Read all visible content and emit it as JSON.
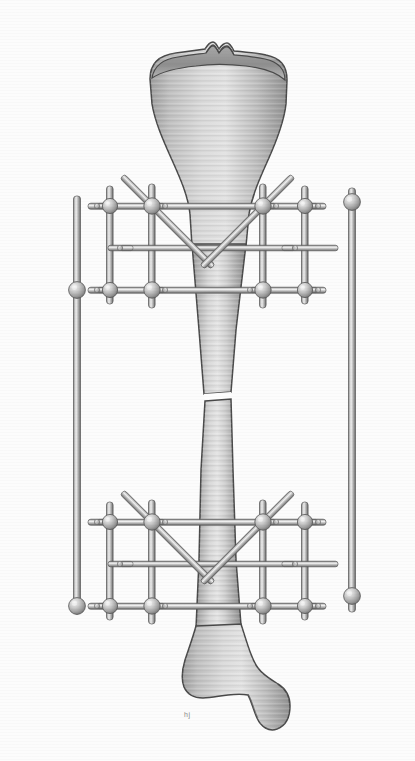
{
  "figure": {
    "view": "anterior",
    "mark": "hj"
  },
  "palette": {
    "background": "#fcfcfc",
    "bone_outline": "#4a4a4a",
    "bone_light": "#e2e2e2",
    "bone_mid": "#b9b9b9",
    "bone_dark": "#8e8e8e",
    "metal_light": "#e6e6e6",
    "metal_mid": "#b0b0b0",
    "metal_dark": "#6f6f6f",
    "metal_outline": "#5a5a5a"
  },
  "anatomy": {
    "parts": [
      {
        "name": "tibial-plateau",
        "label": "Tibial plateau",
        "y": 52
      },
      {
        "name": "intercondylar-eminence",
        "label": "Intercondylar eminence",
        "y": 46
      },
      {
        "name": "tibial-tuberosity",
        "label": "Tibial tuberosity",
        "y": 150
      },
      {
        "name": "tibial-shaft",
        "label": "Tibial shaft (diaphysis)",
        "y": 300
      },
      {
        "name": "fracture-site",
        "label": "Transverse fracture",
        "y": 397
      },
      {
        "name": "distal-metaphysis",
        "label": "Distal metaphysis",
        "y": 650
      },
      {
        "name": "medial-malleolus",
        "label": "Medial malleolus",
        "y": 710
      }
    ],
    "fracture": {
      "type": "transverse",
      "location": "mid-diaphysis",
      "gap_px": 9,
      "center_y": 397
    }
  },
  "fixator": {
    "type": "bilateral-external-fixator",
    "clamp_count": 16,
    "long_rod_count": 2,
    "frames": [
      {
        "name": "proximal-frame",
        "rows": [
          {
            "name": "row-upper",
            "y": 206
          },
          {
            "name": "row-lower",
            "y": 290
          }
        ],
        "mid_bar_y": 248
      },
      {
        "name": "distal-frame",
        "rows": [
          {
            "name": "row-upper",
            "y": 522
          },
          {
            "name": "row-lower",
            "y": 606
          }
        ],
        "mid_bar_y": 564
      }
    ],
    "vertical_rods": [
      {
        "name": "rod-outer-left",
        "x": 77
      },
      {
        "name": "rod-inner-left",
        "x": 110
      },
      {
        "name": "rod-pin-left",
        "x": 152
      },
      {
        "name": "rod-pin-right",
        "x": 263
      },
      {
        "name": "rod-inner-right",
        "x": 305
      },
      {
        "name": "rod-outer-right",
        "x": 352
      }
    ],
    "diagonal_braces": 4
  }
}
